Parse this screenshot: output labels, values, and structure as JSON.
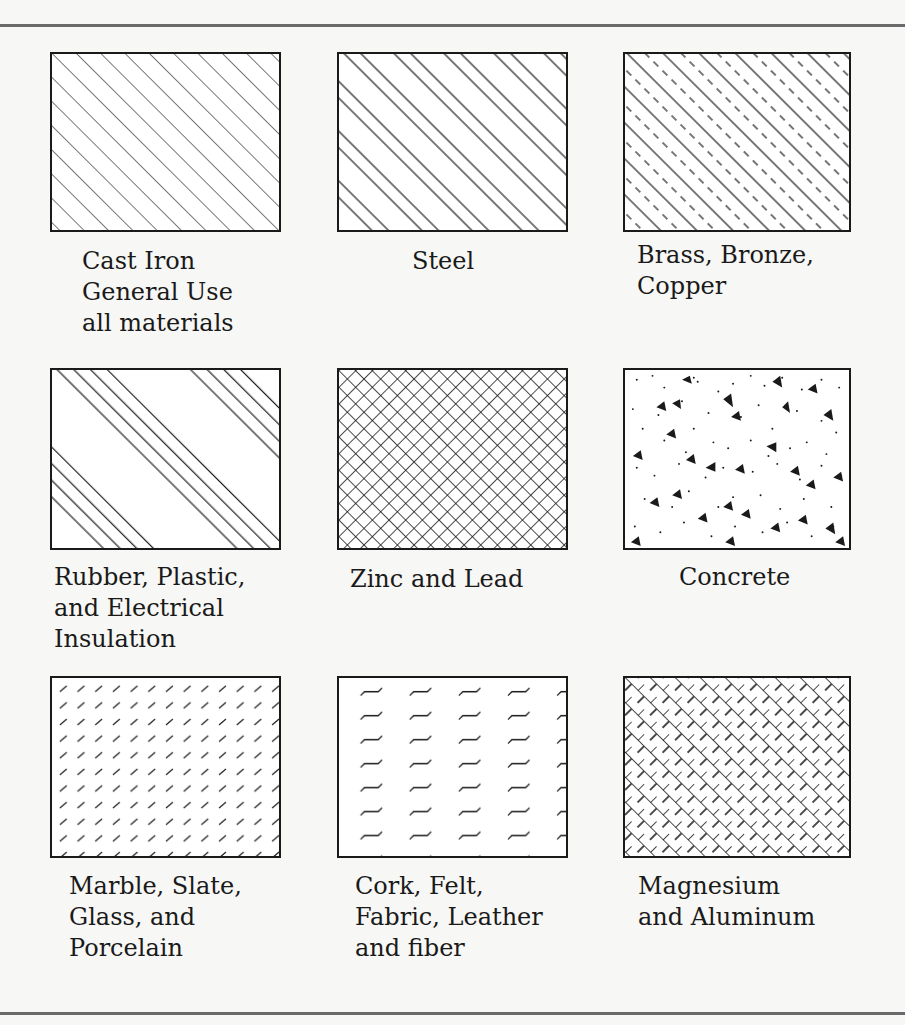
{
  "colors": {
    "ink": "#1a1a1a",
    "paper": "#f7f7f5",
    "rule": "#6a6a6a"
  },
  "materials": [
    {
      "id": "cast-iron",
      "label": "Cast Iron\nGeneral Use\nall materials",
      "pattern": "fine-diagonal-hatch"
    },
    {
      "id": "steel",
      "label": "Steel",
      "pattern": "paired-diagonal-hatch"
    },
    {
      "id": "brass",
      "label": "Brass, Bronze,\nCopper",
      "pattern": "alternating-solid-dashed-hatch"
    },
    {
      "id": "rubber",
      "label": "Rubber, Plastic,\nand Electrical\nInsulation",
      "pattern": "grouped-four-line-hatch"
    },
    {
      "id": "zinc",
      "label": "Zinc and Lead",
      "pattern": "dense-crosshatch"
    },
    {
      "id": "concrete",
      "label": "Concrete",
      "pattern": "stipple-with-aggregate"
    },
    {
      "id": "marble",
      "label": "Marble, Slate,\nGlass, and\nPorcelain",
      "pattern": "short-diagonal-dashes"
    },
    {
      "id": "cork",
      "label": "Cork, Felt,\nFabric, Leather\nand fiber",
      "pattern": "wavy-dashes"
    },
    {
      "id": "magnesium",
      "label": "Magnesium\nand Aluminum",
      "pattern": "broken-crosshatch"
    }
  ]
}
